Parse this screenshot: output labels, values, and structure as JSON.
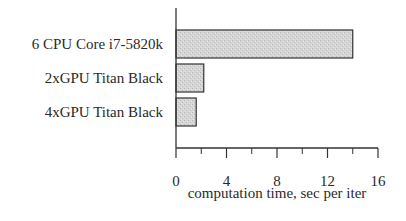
{
  "chart_data": {
    "type": "bar",
    "orientation": "horizontal",
    "title": "",
    "categories": [
      "6 CPU Core i7-5820k",
      "2xGPU Titan Black",
      "4xGPU Titan Black"
    ],
    "values": [
      14.0,
      2.2,
      1.6
    ],
    "xlabel": "computation time, sec per iter",
    "ylabel": "",
    "xlim": [
      0,
      16
    ],
    "xticks": [
      0,
      4,
      8,
      12,
      16
    ],
    "minor_ticks": [
      2,
      6,
      10,
      14
    ],
    "grid": false,
    "legend": null,
    "bar_color": "#d4d4d4",
    "bar_edge_color": "#333333"
  }
}
